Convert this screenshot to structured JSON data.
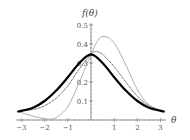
{
  "chart_data": {
    "type": "line",
    "title": "",
    "xlabel": "θ",
    "ylabel": "f(θ)",
    "xlim": [
      -3.1416,
      3.1416
    ],
    "ylim": [
      0,
      0.5
    ],
    "grid": false,
    "legend": null,
    "x_ticks": [
      -3,
      -2,
      -1,
      1,
      2,
      3
    ],
    "x_tick_labels": [
      "−3",
      "−2",
      "−1",
      "1",
      "2",
      "3"
    ],
    "y_ticks": [
      0.1,
      0.2,
      0.3,
      0.4,
      0.5
    ],
    "y_tick_labels": [
      "0.1",
      "0.2",
      "0.3",
      "0.4",
      "0.5"
    ],
    "series": [
      {
        "name": "thick-solid",
        "style": "solid-thick",
        "color": "#000000",
        "x": [
          -3.14,
          -2.5,
          -2.0,
          -1.5,
          -1.0,
          -0.5,
          0.0,
          0.5,
          1.0,
          1.5,
          2.0,
          2.5,
          3.14
        ],
        "values": [
          0.045,
          0.065,
          0.1,
          0.155,
          0.225,
          0.3,
          0.345,
          0.3,
          0.225,
          0.155,
          0.1,
          0.065,
          0.045
        ]
      },
      {
        "name": "dashed",
        "style": "dashed",
        "color": "#555555",
        "x": [
          -3.14,
          -2.5,
          -2.0,
          -1.5,
          -1.0,
          -0.5,
          0.0,
          0.2,
          0.5,
          1.0,
          1.5,
          2.0,
          2.5,
          3.14
        ],
        "values": [
          0.045,
          0.055,
          0.075,
          0.115,
          0.18,
          0.27,
          0.345,
          0.36,
          0.345,
          0.28,
          0.2,
          0.125,
          0.075,
          0.045
        ]
      },
      {
        "name": "thin-skewed",
        "style": "solid-thin",
        "color": "#999999",
        "x": [
          -3.14,
          -2.5,
          -2.0,
          -1.8,
          -1.5,
          -1.0,
          -0.5,
          0.0,
          0.3,
          0.6,
          1.0,
          1.5,
          2.0,
          2.5,
          3.14
        ],
        "values": [
          0.045,
          0.02,
          0.007,
          0.005,
          0.012,
          0.07,
          0.2,
          0.345,
          0.42,
          0.44,
          0.405,
          0.29,
          0.16,
          0.08,
          0.045
        ]
      }
    ]
  }
}
